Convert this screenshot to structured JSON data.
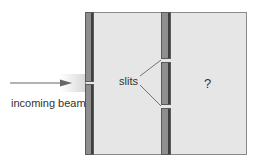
{
  "diagram": {
    "beam_label": "incoming beam",
    "slits_label": "slits",
    "screen_label": "?",
    "colors": {
      "background": "#e6e6e6",
      "wall": "#8e8e8e",
      "wall_edge": "#3e3e3e",
      "arrow": "#666666",
      "text": "#333333"
    }
  }
}
